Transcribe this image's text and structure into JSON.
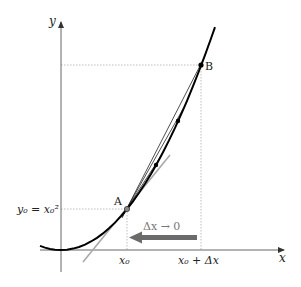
{
  "figure": {
    "function": "y = x^2",
    "axes": {
      "x_label": "x",
      "y_label": "y",
      "x_ticks": [
        {
          "label": "x0",
          "text": "x₀"
        },
        {
          "label": "x0_plus_dx",
          "text": "x₀ + Δx"
        }
      ],
      "y_ticks": [
        {
          "label": "y0",
          "text": "y₀ = x₀²"
        }
      ]
    },
    "points": [
      {
        "name": "A",
        "label": "A"
      },
      {
        "name": "B",
        "label": "B"
      }
    ],
    "annotation": {
      "arrow_text": "Δx → 0",
      "arrow_color": "#6b6b6b"
    },
    "colors": {
      "curve": "#000000",
      "tangent": "#a8a8a8",
      "secant": "#222222",
      "guide": "#bdbdbd",
      "axis": "#555555"
    }
  }
}
